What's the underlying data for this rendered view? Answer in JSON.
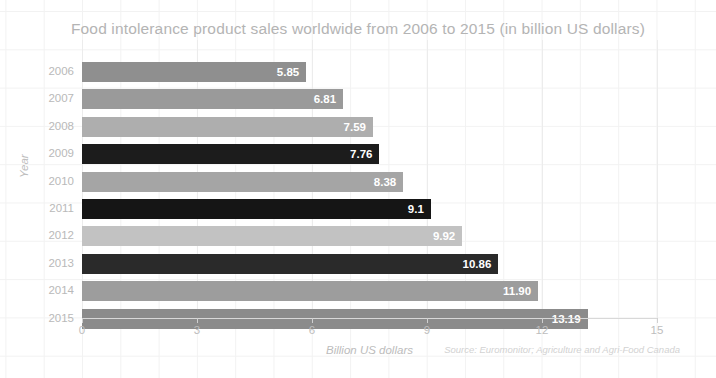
{
  "chart_data": {
    "type": "bar",
    "orientation": "horizontal",
    "title": "Food intolerance product sales worldwide from 2006 to 2015 (in billion US dollars)",
    "xlabel": "Billion US dollars",
    "ylabel": "Year",
    "categories": [
      "2006",
      "2007",
      "2008",
      "2009",
      "2010",
      "2011",
      "2012",
      "2013",
      "2014",
      "2015"
    ],
    "values": [
      5.85,
      6.81,
      7.59,
      7.76,
      8.38,
      9.1,
      9.92,
      10.86,
      11.9,
      13.19
    ],
    "value_labels": [
      "5.85",
      "6.81",
      "7.59",
      "7.76",
      "8.38",
      "9.1",
      "9.92",
      "10.86",
      "11.90",
      "13.19"
    ],
    "bar_colors": [
      "#8f8f8f",
      "#9a9a9a",
      "#aeaeae",
      "#1c1c1c",
      "#a5a5a5",
      "#151515",
      "#c2c2c2",
      "#2a2a2a",
      "#9d9d9d",
      "#8b8b8b"
    ],
    "xlim": [
      0,
      15
    ],
    "xticks": [
      "0",
      "3",
      "6",
      "9",
      "12",
      "15"
    ],
    "xtick_values": [
      0,
      3,
      6,
      9,
      12,
      15
    ],
    "grid": true,
    "legend": "none",
    "source": "Source: Euromonitor; Agriculture and Agri-Food Canada"
  },
  "colors": {
    "background": "#ffffff",
    "grid": "#f2f2f2",
    "title_text": "#b4b4b4",
    "tick_text": "#bdbdbd",
    "axis_line": "#d8d8d8",
    "value_text": "#ffffff",
    "source_text": "#d2d2d2"
  }
}
